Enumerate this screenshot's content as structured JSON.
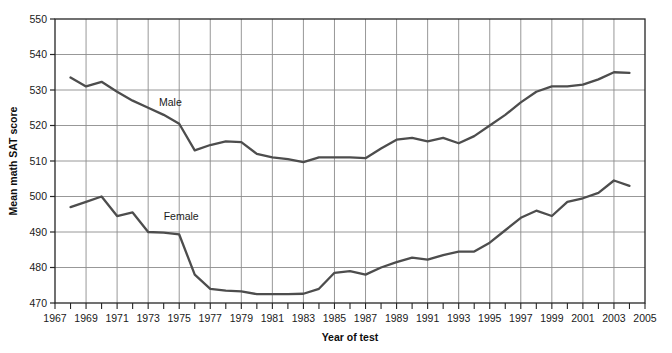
{
  "chart_data": {
    "type": "line",
    "title": "",
    "xlabel": "Year of test",
    "ylabel": "Mean math SAT score",
    "xlim": [
      1967,
      2005
    ],
    "ylim": [
      470,
      550
    ],
    "xticks": [
      1967,
      1969,
      1971,
      1973,
      1975,
      1977,
      1979,
      1981,
      1983,
      1985,
      1987,
      1989,
      1991,
      1993,
      1995,
      1997,
      1999,
      2001,
      2003,
      2005
    ],
    "xtick_labels": [
      "1967",
      "1969",
      "1971",
      "1973",
      "1975",
      "1977",
      "1979",
      "1981",
      "1983",
      "1985",
      "1987",
      "1989",
      "1991",
      "1993",
      "1995",
      "1997",
      "1999",
      "2001",
      "2003",
      "2005"
    ],
    "yticks": [
      470,
      480,
      490,
      500,
      510,
      520,
      530,
      540,
      550
    ],
    "ytick_labels": [
      "470",
      "480",
      "490",
      "500",
      "510",
      "520",
      "530",
      "540",
      "550"
    ],
    "grid": true,
    "grid_x_step": 2,
    "grid_y_step": 10,
    "legend_position": "inline-annotation",
    "line_color": "#4d4d4d",
    "grid_color": "#8c8c8c",
    "axis_color": "#262626",
    "x": [
      1968,
      1969,
      1970,
      1971,
      1972,
      1973,
      1974,
      1975,
      1976,
      1977,
      1978,
      1979,
      1980,
      1981,
      1982,
      1983,
      1984,
      1985,
      1986,
      1987,
      1988,
      1989,
      1990,
      1991,
      1992,
      1993,
      1994,
      1995,
      1996,
      1997,
      1998,
      1999,
      2000,
      2001,
      2002,
      2003,
      2004
    ],
    "series": [
      {
        "name": "Male",
        "label": "Male",
        "label_x": 1973.7,
        "label_y": 525.5,
        "values": [
          533.5,
          531.0,
          532.3,
          529.5,
          527.0,
          525.0,
          523.0,
          520.5,
          513.0,
          514.5,
          515.5,
          515.3,
          512.0,
          511.0,
          510.5,
          509.7,
          511.0,
          511.0,
          511.0,
          510.8,
          513.5,
          516.0,
          516.5,
          515.5,
          516.5,
          515.0,
          517.0,
          520.0,
          523.0,
          526.5,
          529.5,
          531.0,
          531.0,
          531.5,
          533.0,
          535.0,
          534.8
        ]
      },
      {
        "name": "Female",
        "label": "Female",
        "label_x": 1974.0,
        "label_y": 493.5,
        "values": [
          497.0,
          498.5,
          500.0,
          494.5,
          495.5,
          490.0,
          489.8,
          489.3,
          478.0,
          474.0,
          473.5,
          473.3,
          472.5,
          472.5,
          472.5,
          472.6,
          474.0,
          478.5,
          479.0,
          478.0,
          480.0,
          481.5,
          482.8,
          482.2,
          483.5,
          484.5,
          484.5,
          487.0,
          490.5,
          494.0,
          496.0,
          494.5,
          498.5,
          499.5,
          501.0,
          504.5,
          503.0
        ]
      }
    ]
  }
}
